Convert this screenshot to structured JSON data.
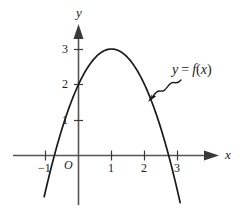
{
  "chart_data": {
    "type": "line",
    "title": "",
    "xlabel": "x",
    "ylabel": "y",
    "curve_label": "y = f(x)",
    "function": "y = 3 - (x - 1)^2",
    "vertex": [
      1,
      3
    ],
    "y_intercept": 2,
    "x_intercepts": [
      -0.73,
      2.73
    ],
    "xlim": [
      -1.05,
      3.1
    ],
    "ylim": [
      -1.2,
      3.6
    ],
    "grid": false,
    "legend": "none",
    "x_ticks": [
      {
        "value": -1,
        "label": "−1"
      },
      {
        "value": 1,
        "label": "1"
      },
      {
        "value": 2,
        "label": "2"
      },
      {
        "value": 3,
        "label": "3"
      }
    ],
    "y_ticks": [
      {
        "value": 1,
        "label": "1"
      },
      {
        "value": 2,
        "label": "2"
      },
      {
        "value": 3,
        "label": "3"
      }
    ],
    "origin_label": "O",
    "x": [
      -0.95,
      -0.75,
      -0.5,
      -0.25,
      0,
      0.25,
      0.5,
      0.75,
      1,
      1.25,
      1.5,
      1.75,
      2,
      2.25,
      2.5,
      2.75,
      3.0
    ],
    "values": [
      -0.8,
      -0.06,
      0.75,
      1.44,
      2,
      2.44,
      2.75,
      2.94,
      3,
      2.94,
      2.75,
      2.44,
      2,
      1.44,
      0.75,
      -0.06,
      -1.0
    ]
  },
  "colors": {
    "axis": "#555555",
    "curve": "#1a1a1a",
    "text": "#1a1a1a",
    "background": "#ffffff"
  },
  "annotations": {
    "curve_label": "y = f(x)",
    "curve_label_y": "y",
    "curve_label_eq": "=",
    "curve_label_f": "f",
    "curve_label_paren_open": "(",
    "curve_label_var": "x",
    "curve_label_paren_close": ")",
    "pointer": "squiggly-arrow"
  }
}
